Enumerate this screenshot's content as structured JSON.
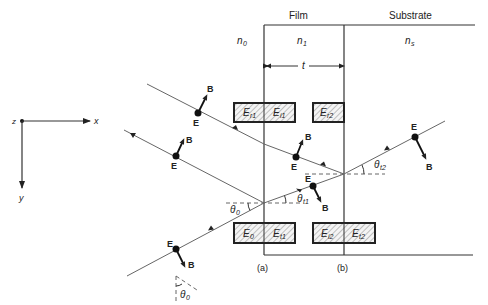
{
  "figure": {
    "headers": {
      "film": "Film",
      "substrate": "Substrate"
    },
    "media": {
      "n0": "n",
      "n0_sub": "0",
      "n1": "n",
      "n1_sub": "1",
      "ns": "n",
      "ns_sub": "s"
    },
    "thickness": "t",
    "axes": {
      "x": "x",
      "y": "y",
      "z": "z"
    },
    "interface_labels": {
      "a": "(a)",
      "b": "(b)"
    },
    "vectors": {
      "E": "E",
      "B": "B"
    },
    "angles": {
      "theta0": {
        "sym": "θ",
        "sub": "0"
      },
      "thetat1": {
        "sym": "θ",
        "sub": "t1"
      },
      "thetat2": {
        "sym": "θ",
        "sub": "t2"
      },
      "theta0_bottom": {
        "sym": "θ",
        "sub": "0"
      }
    },
    "field_boxes_top": [
      {
        "sym": "E",
        "sub": "r1"
      },
      {
        "sym": "E",
        "sub": "i1"
      },
      {
        "sym": "E",
        "sub": "r2"
      }
    ],
    "field_boxes_bottom": [
      {
        "sym": "E",
        "sub": "0"
      },
      {
        "sym": "E",
        "sub": "t1"
      },
      {
        "sym": "E",
        "sub": "i2"
      },
      {
        "sym": "E",
        "sub": "t2"
      }
    ]
  }
}
